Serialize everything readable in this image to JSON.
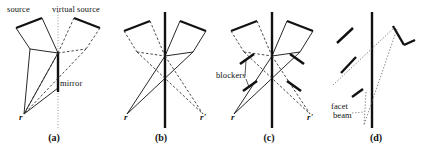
{
  "figure": {
    "width": 427,
    "height": 153,
    "background": "#ffffff",
    "ink": "#111111",
    "dotted_ink": "#555555"
  },
  "panels": [
    {
      "id": "a",
      "caption": "(a)",
      "caption_x": 53,
      "caption_y": 134,
      "labels": [
        {
          "name": "source-label",
          "text": "source",
          "x": 7,
          "y": 7,
          "style": "plain"
        },
        {
          "name": "virtual-source-label",
          "text": "virtual source",
          "x": 52,
          "y": 7,
          "style": "plain"
        },
        {
          "name": "mirror-label",
          "text": "mirror",
          "x": 58,
          "y": 83,
          "style": "plain"
        },
        {
          "name": "r-label",
          "text": "r",
          "x": 19,
          "y": 120,
          "style": "italic"
        }
      ]
    },
    {
      "id": "b",
      "caption": "(b)",
      "caption_x": 160,
      "caption_y": 134,
      "labels": [
        {
          "name": "r-label",
          "text": "r",
          "x": 136,
          "y": 120,
          "style": "italic"
        },
        {
          "name": "r-prime-label",
          "text": "r'",
          "x": 196,
          "y": 120,
          "style": "italic"
        }
      ]
    },
    {
      "id": "c",
      "caption": "(c)",
      "caption_x": 268,
      "caption_y": 134,
      "labels": [
        {
          "name": "blockers-label",
          "text": "blockers",
          "x": 218,
          "y": 75,
          "style": "plain"
        },
        {
          "name": "r-label",
          "text": "r",
          "x": 243,
          "y": 120,
          "style": "italic"
        },
        {
          "name": "r-prime-label",
          "text": "r'",
          "x": 303,
          "y": 120,
          "style": "italic"
        }
      ]
    },
    {
      "id": "d",
      "caption": "(d)",
      "caption_x": 375,
      "caption_y": 134,
      "labels": [
        {
          "name": "facet-beam-label-line1",
          "text": "facet",
          "x": 333,
          "y": 105,
          "style": "plain"
        },
        {
          "name": "facet-beam-label-line2",
          "text": "beam",
          "x": 334,
          "y": 114,
          "style": "plain"
        }
      ]
    }
  ],
  "diagram_elements": {
    "panel_a": {
      "mirror_axis": "dotted vertical line at x=58 from y=14 to y=128",
      "mirror_segment": "thick solid vertical from y=52 to y=92",
      "source_cone": "solid quadrilateral beam from upper-left converging to r",
      "virtual_source_cone": "dashed quadrilateral beam from upper-right converging toward mirror"
    },
    "panel_b": {
      "center_line": "thick solid vertical at x=165 from y=12 to y=128",
      "left_cone": "dashed beam upper-left, rays converge at r'",
      "right_cone": "solid beam upper-right, rays converge at r"
    },
    "panel_c": {
      "center_line": "thick solid vertical at x=272 from y=12 to y=128",
      "blockers_count": 4,
      "blockers": "short thick diagonal segments perpendicular to beam rays"
    },
    "panel_d": {
      "center_line": "thick solid vertical at x=372 from y=12 to y=128",
      "facet_segments": 5,
      "facet_beam": "thin dotted narrow wedge crossing the center line"
    }
  }
}
